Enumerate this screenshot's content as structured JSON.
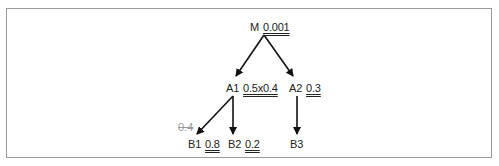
{
  "diagram": {
    "nodes": {
      "M": {
        "name": "M",
        "value": "0.001"
      },
      "A1": {
        "name": "A1",
        "value": "0.5x0.4"
      },
      "A2": {
        "name": "A2",
        "value": "0.3"
      },
      "B1": {
        "name": "B1",
        "value": "0.8"
      },
      "B2": {
        "name": "B2",
        "value": "0.2"
      },
      "B3": {
        "name": "B3",
        "value": ""
      }
    },
    "edges": [
      {
        "from": "M",
        "to": "A1"
      },
      {
        "from": "M",
        "to": "A2"
      },
      {
        "from": "A1",
        "to": "B1",
        "label": "0.4",
        "label_struck": true
      },
      {
        "from": "A1",
        "to": "B2"
      },
      {
        "from": "A2",
        "to": "B3"
      }
    ],
    "struck_label": "0.4"
  }
}
